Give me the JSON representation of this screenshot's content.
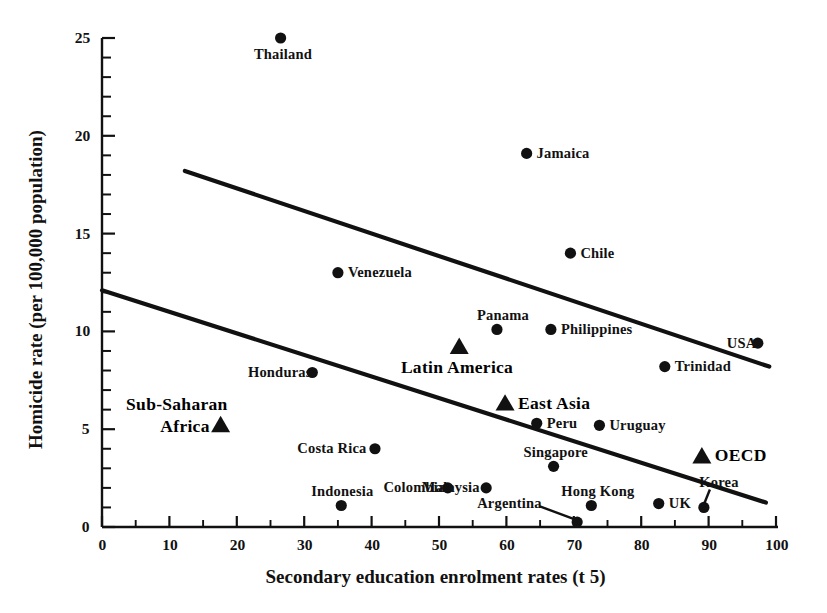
{
  "chart_data": {
    "type": "scatter",
    "title": "",
    "xlabel": "Secondary education enrolment rates (t  5)",
    "ylabel": "Homicide rate (per 100,000 population)",
    "xlim": [
      0,
      100
    ],
    "ylim": [
      0,
      25
    ],
    "xticks": [
      0,
      10,
      20,
      30,
      40,
      50,
      60,
      70,
      80,
      90,
      100
    ],
    "xtick_labels": [
      "0",
      "10",
      "20",
      "30",
      "40",
      "50",
      "60",
      "70",
      "80",
      "90",
      "100"
    ],
    "yticks": [
      0,
      5,
      10,
      15,
      20,
      25
    ],
    "ytick_labels": [
      "0",
      "5",
      "10",
      "15",
      "20",
      "25"
    ],
    "minor_tick_step_x": 5,
    "minor_tick_step_y": 1,
    "grid": false,
    "legend": "none",
    "points": [
      {
        "name": "Thailand",
        "x": 26.5,
        "y": 25.0,
        "marker": "circle",
        "label_pos": "below"
      },
      {
        "name": "Jamaica",
        "x": 63.0,
        "y": 19.1,
        "marker": "circle",
        "label_pos": "right"
      },
      {
        "name": "Chile",
        "x": 69.5,
        "y": 14.0,
        "marker": "circle",
        "label_pos": "right"
      },
      {
        "name": "Venezuela",
        "x": 35.0,
        "y": 13.0,
        "marker": "circle",
        "label_pos": "right"
      },
      {
        "name": "Panama",
        "x": 58.6,
        "y": 10.1,
        "marker": "circle",
        "label_pos": "above"
      },
      {
        "name": "Philippines",
        "x": 66.6,
        "y": 10.1,
        "marker": "circle",
        "label_pos": "right"
      },
      {
        "name": "USA",
        "x": 97.3,
        "y": 9.4,
        "marker": "circle",
        "label_pos": "left"
      },
      {
        "name": "Trinidad",
        "x": 83.5,
        "y": 8.2,
        "marker": "circle",
        "label_pos": "right"
      },
      {
        "name": "Honduras",
        "x": 31.2,
        "y": 7.9,
        "marker": "circle",
        "label_pos": "left"
      },
      {
        "name": "Peru",
        "x": 64.5,
        "y": 5.3,
        "marker": "circle",
        "label_pos": "right"
      },
      {
        "name": "Uruguay",
        "x": 73.8,
        "y": 5.2,
        "marker": "circle",
        "label_pos": "right"
      },
      {
        "name": "Costa Rica",
        "x": 40.5,
        "y": 4.0,
        "marker": "circle",
        "label_pos": "left"
      },
      {
        "name": "OECD",
        "x": 89.0,
        "y": 3.6,
        "marker": "triangle",
        "label_pos": "right",
        "group": true
      },
      {
        "name": "Singapore",
        "x": 67.0,
        "y": 3.1,
        "marker": "circle",
        "label_pos": "above"
      },
      {
        "name": "Malaysia",
        "x": 57.0,
        "y": 2.0,
        "marker": "circle",
        "label_pos": "left"
      },
      {
        "name": "Colombia",
        "x": 51.3,
        "y": 2.0,
        "marker": "circle",
        "label_pos": "left"
      },
      {
        "name": "UK",
        "x": 82.6,
        "y": 1.2,
        "marker": "circle",
        "label_pos": "right"
      },
      {
        "name": "Korea",
        "x": 89.3,
        "y": 1.0,
        "marker": "circle",
        "label_pos": "leader-up"
      },
      {
        "name": "Hong Kong",
        "x": 72.6,
        "y": 1.1,
        "marker": "circle",
        "label_pos": "above"
      },
      {
        "name": "Indonesia",
        "x": 35.5,
        "y": 1.1,
        "marker": "circle",
        "label_pos": "above"
      },
      {
        "name": "Argentina",
        "x": 70.5,
        "y": 0.25,
        "marker": "circle",
        "label_pos": "leader-left"
      },
      {
        "name": "Latin America",
        "x": 53.0,
        "y": 9.2,
        "marker": "triangle",
        "label_pos": "below-left",
        "group": true
      },
      {
        "name": "East Asia",
        "x": 59.8,
        "y": 6.3,
        "marker": "triangle",
        "label_pos": "right",
        "group": true
      },
      {
        "name": "Sub-Saharan Africa",
        "x": 17.6,
        "y": 5.2,
        "marker": "triangle",
        "label_pos": "left",
        "group": true
      }
    ],
    "trend_lines": [
      {
        "name": "upper-regression-line",
        "x1": 12.3,
        "y1": 18.2,
        "x2": 99.0,
        "y2": 8.2
      },
      {
        "name": "lower-regression-line",
        "x1": 0.0,
        "y1": 12.1,
        "x2": 98.5,
        "y2": 1.25
      }
    ],
    "group_label_lines": [
      {
        "name": "sub-saharan-africa-label",
        "line1": "Sub-Saharan",
        "line2": "Africa"
      }
    ]
  },
  "axis": {
    "x_title": "Secondary education enrolment rates (t  5)",
    "y_title": "Homicide rate (per 100,000 population)"
  }
}
